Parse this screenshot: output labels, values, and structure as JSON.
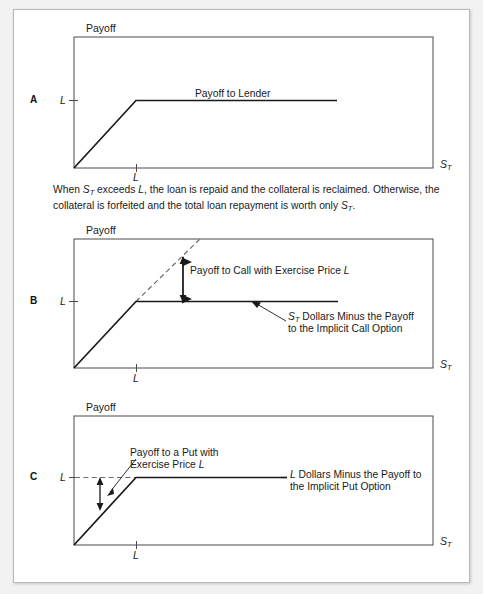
{
  "figure": {
    "background_color": "#f2f2f2",
    "card_color": "#ffffff",
    "line_color": "#1a1a1a",
    "axis_color": "#4a4a4a",
    "dashed_color": "#6b6b6b"
  },
  "panels": [
    {
      "letter": "A",
      "y_axis_title": "Payoff",
      "x_axis_label": "S",
      "x_axis_label_sub": "T",
      "y_tick_label": "L",
      "x_tick_label": "L",
      "annotations": [
        {
          "name": "payoff-to-lender-label",
          "text": "Payoff to Lender"
        }
      ]
    },
    {
      "letter": "B",
      "y_axis_title": "Payoff",
      "x_axis_label": "S",
      "x_axis_label_sub": "T",
      "y_tick_label": "L",
      "x_tick_label": "L",
      "annotations": [
        {
          "name": "payoff-to-call-label",
          "text": "Payoff to Call with Exercise Price L"
        },
        {
          "name": "st-dollars-minus-call-label-line1",
          "text": "Dollars Minus the Payoff"
        },
        {
          "name": "st-dollars-minus-call-label-line2",
          "text": "to the Implicit Call Option"
        }
      ]
    },
    {
      "letter": "C",
      "y_axis_title": "Payoff",
      "x_axis_label": "S",
      "x_axis_label_sub": "T",
      "y_tick_label": "L",
      "x_tick_label": "L",
      "annotations": [
        {
          "name": "payoff-to-put-label-line1",
          "text": "Payoff to a Put with"
        },
        {
          "name": "payoff-to-put-label-line2",
          "text": "Exercise Price L"
        },
        {
          "name": "l-dollars-minus-put-label-line1",
          "text": "Dollars Minus the Payoff to"
        },
        {
          "name": "l-dollars-minus-put-label-line2",
          "text": "the Implicit Put Option"
        }
      ]
    }
  ],
  "caption": {
    "line1_pre": "When ",
    "line1_var": "S",
    "line1_sub": "T",
    "line1_mid": " exceeds ",
    "line1_var2": "L",
    "line1_post": ", the loan is repaid and the collateral is reclaimed. Otherwise,",
    "line2_pre": "the collateral is forfeited and the total loan repayment is worth only ",
    "line2_var": "S",
    "line2_sub": "T",
    "line2_post": "."
  },
  "chart_data": {
    "type": "line",
    "xlabel": "S_T",
    "ylabel": "Payoff",
    "grid": false,
    "legend": "none",
    "panels": [
      {
        "id": "A",
        "label": "A",
        "description": "Payoff to lender on a collateralized loan: min(S_T, L)",
        "xlim": [
          0,
          1
        ],
        "ylim": [
          0,
          1
        ],
        "x_ticks": [
          {
            "value": 0.17,
            "label": "L"
          }
        ],
        "y_ticks": [
          {
            "value": 0.41,
            "label": "L"
          }
        ],
        "series": [
          {
            "name": "Payoff to Lender",
            "style": "solid",
            "points": [
              [
                0.0,
                0.0
              ],
              [
                0.17,
                0.41
              ],
              [
                0.73,
                0.41
              ]
            ]
          }
        ],
        "annotations": [
          {
            "text": "Payoff to Lender",
            "x": 0.46,
            "y": 0.48
          }
        ]
      },
      {
        "id": "B",
        "label": "B",
        "description": "Lender payoff = S_T dollars minus the payoff to an implicit call option with exercise price L",
        "xlim": [
          0,
          1
        ],
        "ylim": [
          0,
          1
        ],
        "x_ticks": [
          {
            "value": 0.17,
            "label": "L"
          }
        ],
        "y_ticks": [
          {
            "value": 0.48,
            "label": "L"
          }
        ],
        "series": [
          {
            "name": "S_T Dollars Minus the Payoff to the Implicit Call Option",
            "style": "solid",
            "points": [
              [
                0.0,
                0.0
              ],
              [
                0.17,
                0.52
              ],
              [
                0.73,
                0.52
              ]
            ]
          },
          {
            "name": "Value of collateral S_T (45-degree reference)",
            "style": "dashed",
            "points": [
              [
                0.17,
                0.52
              ],
              [
                0.35,
                1.0
              ]
            ]
          }
        ],
        "annotations": [
          {
            "text": "Payoff to Call with Exercise Price L",
            "x": 0.32,
            "y": 0.72
          },
          {
            "text": "S_T Dollars Minus the Payoff to the Implicit Call Option",
            "x": 0.6,
            "y": 0.36
          }
        ],
        "measures": [
          {
            "name": "Payoff to Call with Exercise Price L",
            "type": "vertical-double-arrow",
            "x": 0.3,
            "y_from": 0.52,
            "y_to": 0.85
          }
        ]
      },
      {
        "id": "C",
        "label": "C",
        "description": "Lender payoff = L dollars minus the payoff to an implicit put option with exercise price L",
        "xlim": [
          0,
          1
        ],
        "ylim": [
          0,
          1
        ],
        "x_ticks": [
          {
            "value": 0.17,
            "label": "L"
          }
        ],
        "y_ticks": [
          {
            "value": 0.48,
            "label": "L"
          }
        ],
        "series": [
          {
            "name": "L Dollars Minus the Payoff to the Implicit Put Option",
            "style": "solid",
            "points": [
              [
                0.0,
                0.0
              ],
              [
                0.17,
                0.52
              ],
              [
                0.57,
                0.52
              ]
            ]
          },
          {
            "name": "L reference level",
            "style": "dashed",
            "points": [
              [
                0.0,
                0.52
              ],
              [
                0.17,
                0.52
              ]
            ]
          }
        ],
        "annotations": [
          {
            "text": "Payoff to a Put with Exercise Price L",
            "x": 0.17,
            "y": 0.72
          },
          {
            "text": "L Dollars Minus the Payoff to the Implicit Put Option",
            "x": 0.6,
            "y": 0.52
          }
        ],
        "measures": [
          {
            "name": "Payoff to a Put with Exercise Price L",
            "type": "vertical-double-arrow",
            "x": 0.07,
            "y_from": 0.26,
            "y_to": 0.52
          }
        ]
      }
    ]
  }
}
